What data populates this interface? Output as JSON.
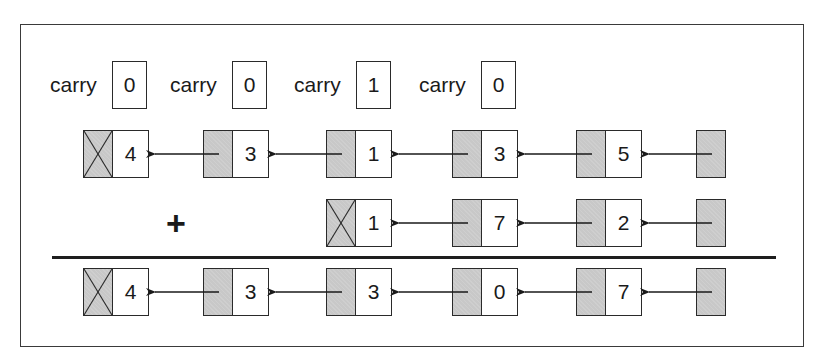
{
  "diagram": {
    "carries": [
      {
        "label": "carry",
        "value": "0"
      },
      {
        "label": "carry",
        "value": "0"
      },
      {
        "label": "carry",
        "value": "1"
      },
      {
        "label": "carry",
        "value": "0"
      }
    ],
    "operand_a": {
      "nodes": [
        {
          "value": "4",
          "null_pointer": true
        },
        {
          "value": "3",
          "null_pointer": false
        },
        {
          "value": "1",
          "null_pointer": false
        },
        {
          "value": "3",
          "null_pointer": false
        },
        {
          "value": "5",
          "null_pointer": false
        }
      ],
      "head_pointer": true
    },
    "operator": "+",
    "operand_b": {
      "nodes": [
        {
          "value": "1",
          "null_pointer": true
        },
        {
          "value": "7",
          "null_pointer": false
        },
        {
          "value": "2",
          "null_pointer": false
        }
      ],
      "head_pointer": true
    },
    "result": {
      "nodes": [
        {
          "value": "4",
          "null_pointer": true
        },
        {
          "value": "3",
          "null_pointer": false
        },
        {
          "value": "3",
          "null_pointer": false
        },
        {
          "value": "0",
          "null_pointer": false
        },
        {
          "value": "7",
          "null_pointer": false
        }
      ],
      "head_pointer": true
    },
    "colors": {
      "pointer_fill": "#c8c8c8",
      "stroke": "#2a2a2a",
      "background": "#ffffff"
    }
  }
}
